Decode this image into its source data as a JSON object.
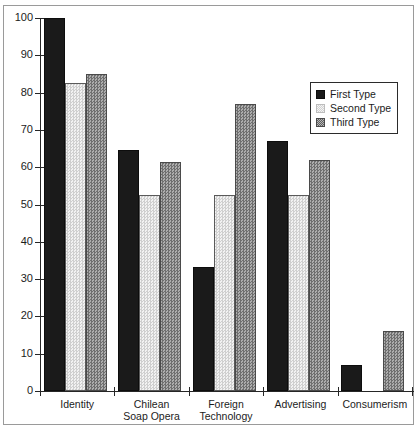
{
  "chart_data": {
    "type": "bar",
    "title": "",
    "subtitle": "",
    "xlabel": "",
    "ylabel": "",
    "ylim": [
      0,
      100
    ],
    "yticks": [
      0,
      10,
      20,
      30,
      40,
      50,
      60,
      70,
      80,
      90,
      100
    ],
    "ytick_labels": [
      "0",
      "10",
      "20",
      "30",
      "40",
      "50",
      "60",
      "70",
      "80",
      "90",
      "100"
    ],
    "grid": false,
    "legend_position": "upper right",
    "categories": [
      "Identity",
      "Chilean\nSoap Opera",
      "Foreign\nTechnology",
      "Advertising",
      "Consumerism"
    ],
    "category_lines": [
      [
        "Identity"
      ],
      [
        "Chilean",
        "Soap Opera"
      ],
      [
        "Foreign",
        "Technology"
      ],
      [
        "Advertising"
      ],
      [
        "Consumerism"
      ]
    ],
    "series": [
      {
        "name": "First Type",
        "color": "#1a1a1a",
        "values": [
          100,
          64.5,
          33.3,
          67,
          7
        ]
      },
      {
        "name": "Second Type",
        "color": "#e2e2e2",
        "values": [
          82.5,
          52.5,
          52.5,
          52.5,
          0
        ]
      },
      {
        "name": "Third Type",
        "color": "#8f8f8f",
        "values": [
          85,
          61.5,
          77,
          62,
          16
        ]
      }
    ]
  },
  "legend": {
    "items": [
      {
        "label": "First Type",
        "swatch": "first"
      },
      {
        "label": "Second Type",
        "swatch": "second"
      },
      {
        "label": "Third Type",
        "swatch": "third"
      }
    ]
  },
  "axis": {
    "y_tick_labels": [
      "100",
      "90",
      "80",
      "70",
      "60",
      "50",
      "40",
      "30",
      "20",
      "10",
      "0"
    ]
  }
}
